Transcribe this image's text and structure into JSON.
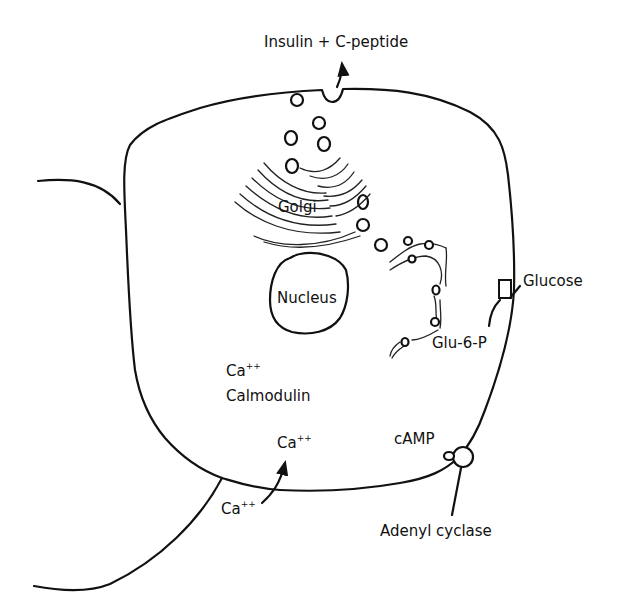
{
  "diagram": {
    "type": "cell-schematic",
    "colors": {
      "stroke": "#111111",
      "background": "#ffffff"
    },
    "labels": {
      "secretion": "Insulin + C-peptide",
      "golgi": "Golgi",
      "nucleus": "Nucleus",
      "glucose": "Glucose",
      "glu6p": "Glu-6-P",
      "ca_intracellular_base": "Ca",
      "ca_intracellular_charge": "++",
      "calmodulin": "Calmodulin",
      "ca_influx_base": "Ca",
      "ca_influx_charge": "++",
      "ca_extracellular_base": "Ca",
      "ca_extracellular_charge": "++",
      "camp": "cAMP",
      "adenyl_cyclase": "Adenyl cyclase"
    },
    "nodes": [
      {
        "id": "golgi",
        "label": "Golgi"
      },
      {
        "id": "nucleus",
        "label": "Nucleus"
      },
      {
        "id": "er",
        "label": "Endoplasmic reticulum (unlabeled)"
      },
      {
        "id": "glucose-transporter",
        "label": "Glucose"
      },
      {
        "id": "adenyl-cyclase",
        "label": "Adenyl cyclase"
      }
    ],
    "edges": [
      {
        "from": "secretory-granule",
        "to": "extracellular",
        "label": "Insulin + C-peptide"
      },
      {
        "from": "extracellular-ca",
        "to": "intracellular-ca",
        "label": "Ca++"
      },
      {
        "from": "glucose",
        "to": "glu-6-p",
        "label": "Glu-6-P"
      },
      {
        "from": "adenyl-cyclase",
        "to": "camp",
        "label": "cAMP"
      }
    ]
  }
}
